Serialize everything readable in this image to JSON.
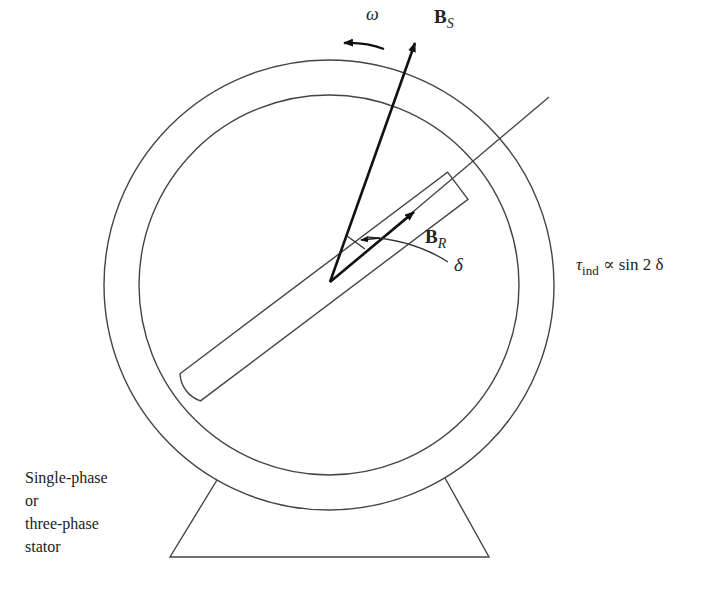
{
  "diagram": {
    "type": "two-pole reluctance motor schematic",
    "labels": {
      "omega": "ω",
      "stator_field": {
        "main": "B",
        "sub": "S"
      },
      "rotor_field": {
        "main": "B",
        "sub": "R"
      },
      "angle": "δ",
      "torque": {
        "tau": "τ",
        "sub": "ind",
        "rest": " ∝ sin 2 δ"
      },
      "stator_lines": [
        "Single-phase",
        "or",
        "three-phase",
        "stator"
      ]
    },
    "colors": {
      "line": "#333333",
      "arrow": "#111111",
      "background": "#ffffff"
    }
  }
}
